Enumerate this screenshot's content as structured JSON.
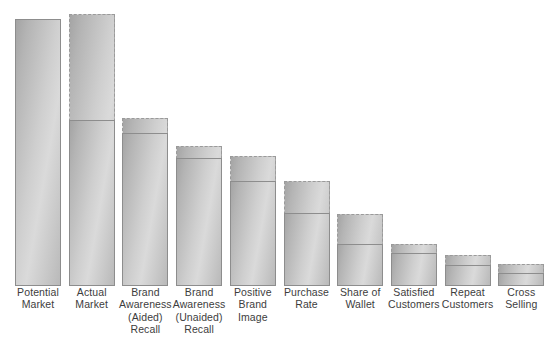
{
  "chart_data": {
    "type": "bar",
    "title": "",
    "subtitle": "",
    "xlabel": "",
    "ylabel": "",
    "ylim": [
      0,
      100
    ],
    "grid": false,
    "legend_position": "none",
    "annotations": [],
    "note": "Marketing funnel / leaky-bucket chart. Each category shows a dashed-outlined potential value and a solid-outlined actual (achieved) value measured as a percentage of the potential market. Bar 1 (Potential Market) has no separate potential envelope.",
    "categories": [
      "Potential\nMarket",
      "Actual\nMarket",
      "Brand\nAwareness\n(Aided)\nRecall",
      "Brand\nAwareness\n(Unaided)\nRecall",
      "Positive\nBrand\nImage",
      "Purchase\nRate",
      "Share of\nWallet",
      "Satisfied\nCustomers",
      "Repeat\nCustomers",
      "Cross\nSelling"
    ],
    "series": [
      {
        "name": "Potential",
        "values": [
          100,
          102,
          63,
          52,
          49,
          39,
          27,
          16,
          12,
          8
        ]
      },
      {
        "name": "Actual",
        "values": [
          100,
          62,
          57,
          48,
          39,
          27,
          16,
          12,
          8,
          5
        ]
      }
    ],
    "bars": [
      {
        "label": "Potential\nMarket",
        "potential": 100,
        "actual": 100,
        "dashed": false
      },
      {
        "label": "Actual\nMarket",
        "potential": 102,
        "actual": 62,
        "dashed": true
      },
      {
        "label": "Brand\nAwareness\n(Aided)\nRecall",
        "potential": 63,
        "actual": 57,
        "dashed": true
      },
      {
        "label": "Brand\nAwareness\n(Unaided)\nRecall",
        "potential": 52,
        "actual": 48,
        "dashed": true
      },
      {
        "label": "Positive\nBrand\nImage",
        "potential": 49,
        "actual": 39,
        "dashed": true
      },
      {
        "label": "Purchase\nRate",
        "potential": 39,
        "actual": 27,
        "dashed": true
      },
      {
        "label": "Share of\nWallet",
        "potential": 27,
        "actual": 16,
        "dashed": true
      },
      {
        "label": "Satisfied\nCustomers",
        "potential": 16,
        "actual": 12,
        "dashed": true
      },
      {
        "label": "Repeat\nCustomers",
        "potential": 12,
        "actual": 8,
        "dashed": true
      },
      {
        "label": "Cross\nSelling",
        "potential": 8,
        "actual": 5,
        "dashed": true
      }
    ],
    "colors": {
      "bar_fill_dark": "#a4a4a4",
      "bar_fill_light": "#dadada",
      "solid_border": "#8d8d8d",
      "dashed_border": "#9a9a9a",
      "label_text": "#3d3d3d",
      "background": "#ffffff"
    }
  },
  "geometry": {
    "baseline_y": 285,
    "bar_width": 46,
    "bar_pitch": 53.7,
    "first_bar_left": 15,
    "potential_tops": [
      18,
      13,
      117,
      145,
      155,
      180,
      213,
      243,
      254,
      263
    ],
    "actual_tops": [
      18,
      119,
      132,
      157,
      180,
      212,
      243,
      252,
      264,
      272
    ]
  }
}
